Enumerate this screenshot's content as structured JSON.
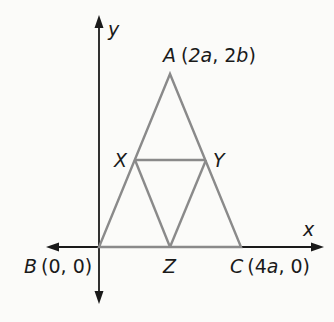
{
  "diagram": {
    "type": "coordinate-geometry",
    "axes": {
      "x_label": "x",
      "y_label": "y"
    },
    "points": {
      "A": {
        "name": "A",
        "coords": "(2a, 2b)",
        "label": "A (2a, 2b)"
      },
      "B": {
        "name": "B",
        "coords": "(0, 0)",
        "label": "B (0, 0)"
      },
      "C": {
        "name": "C",
        "coords": "(4a, 0)",
        "label": "C (4a, 0)"
      },
      "X": {
        "name": "X",
        "label": "X"
      },
      "Y": {
        "name": "Y",
        "label": "Y"
      },
      "Z": {
        "name": "Z",
        "label": "Z"
      }
    },
    "segments": [
      "AB",
      "AC",
      "BC",
      "XY",
      "XZ",
      "YZ"
    ],
    "colors": {
      "triangle_stroke": "#8a8a8a",
      "axis_stroke": "#1a1a1a",
      "text": "#1a1a1a"
    }
  }
}
